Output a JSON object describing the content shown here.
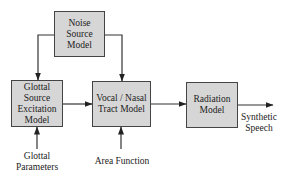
{
  "diagram": {
    "type": "block-diagram",
    "blocks": {
      "noise": "Noise\nSource\nModel",
      "glottal": "Glottal\nSource\nExcitation\nModel",
      "vocal": "Vocal / Nasal\nTract Model",
      "radiation": "Radiation\nModel"
    },
    "inputs": {
      "glottal_params": "Glottal\nParameters",
      "area_function": "Area Function"
    },
    "output": "Synthetic\nSpeech",
    "edges": [
      [
        "Noise Source Model",
        "Glottal Source Excitation Model"
      ],
      [
        "Noise Source Model",
        "Vocal / Nasal Tract Model"
      ],
      [
        "Glottal Source Excitation Model",
        "Vocal / Nasal Tract Model"
      ],
      [
        "Vocal / Nasal Tract Model",
        "Radiation Model"
      ],
      [
        "Radiation Model",
        "Synthetic Speech"
      ],
      [
        "Glottal Parameters",
        "Glottal Source Excitation Model"
      ],
      [
        "Area Function",
        "Vocal / Nasal Tract Model"
      ]
    ],
    "colors": {
      "block_fill": "#d6d6d6",
      "stroke": "#333333"
    }
  }
}
